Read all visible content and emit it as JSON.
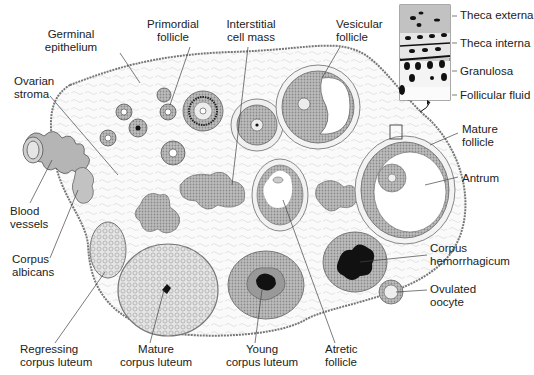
{
  "figure": {
    "colors": {
      "stroke": "#555555",
      "cell_fill": "#a9a9a9",
      "dark_fill": "#1a1a1a",
      "stroma_fill": "#f7f7f7",
      "text": "#222222",
      "vessel_fill": "#b5b5b5"
    }
  },
  "labels": [
    {
      "id": "germinal-epithelium",
      "text": "Germinal\nepithelium",
      "x": 63,
      "y": 30,
      "align": "c"
    },
    {
      "id": "primordial-follicle",
      "text": "Primordial\nfollicle",
      "x": 173,
      "y": 20,
      "align": "c"
    },
    {
      "id": "interstitial-cell-mass",
      "text": "Interstitial\ncell mass",
      "x": 248,
      "y": 20,
      "align": "c"
    },
    {
      "id": "vesicular-follicle",
      "text": "Vesicular\nfollicle",
      "x": 340,
      "y": 20,
      "align": "l"
    },
    {
      "id": "ovarian-stroma",
      "text": "Ovarian\nstroma",
      "x": 14,
      "y": 77,
      "align": "l"
    },
    {
      "id": "blood-vessels",
      "text": "Blood\nvessels",
      "x": 10,
      "y": 205,
      "align": "l"
    },
    {
      "id": "corpus-albicans",
      "text": "Corpus\nalbicans",
      "x": 12,
      "y": 253,
      "align": "l"
    },
    {
      "id": "regressing-corpus-luteum",
      "text": "Regressing\ncorpus luteum",
      "x": 20,
      "y": 345,
      "align": "l"
    },
    {
      "id": "mature-corpus-luteum",
      "text": "Mature\ncorpus luteum",
      "x": 115,
      "y": 345,
      "align": "c"
    },
    {
      "id": "young-corpus-luteum",
      "text": "Young\ncorpus luteum",
      "x": 225,
      "y": 345,
      "align": "c"
    },
    {
      "id": "atretic-follicle",
      "text": "Atretic\nfollicle",
      "x": 325,
      "y": 345,
      "align": "l"
    },
    {
      "id": "mature-follicle",
      "text": "Mature\nfollicle",
      "x": 462,
      "y": 125,
      "align": "l"
    },
    {
      "id": "antrum",
      "text": "Antrum",
      "x": 462,
      "y": 170,
      "align": "l"
    },
    {
      "id": "corpus-hemorrhagicum",
      "text": "Corpus\nhemorrhagicum",
      "x": 430,
      "y": 245,
      "align": "l"
    },
    {
      "id": "ovulated-oocyte",
      "text": "Ovulated\noocyte",
      "x": 430,
      "y": 283,
      "align": "l"
    }
  ],
  "inset": {
    "labels": [
      {
        "id": "theca-externa",
        "text": "Theca externa",
        "x": 460,
        "y": 10
      },
      {
        "id": "theca-interna",
        "text": "Theca interna",
        "x": 460,
        "y": 38
      },
      {
        "id": "granulosa",
        "text": "Granulosa",
        "x": 460,
        "y": 66
      },
      {
        "id": "follicular-fluid",
        "text": "Follicular fluid",
        "x": 460,
        "y": 90
      }
    ]
  }
}
